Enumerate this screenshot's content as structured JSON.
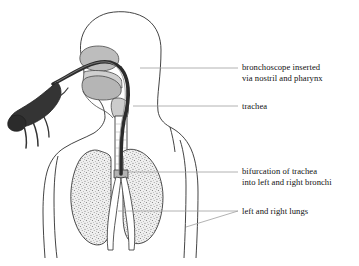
{
  "figure": {
    "colors": {
      "background": "#ffffff",
      "outline": "#2b2b2b",
      "soft_tissue_fill": "#b9b9b9",
      "soft_tissue_fill_light": "#cfcfcf",
      "lung_fill": "#e8e8e8",
      "lung_stipple": "#5d5d5d",
      "scope_dark": "#2e2e2e",
      "scope_handle": "#3a3a3a",
      "leader_line": "#9a9a9a",
      "text": "#111111"
    }
  },
  "labels": [
    {
      "id": "bronchoscope",
      "name": "bronchoscope-label",
      "lines": [
        "bronchoscope inserted",
        "via nostril and pharynx"
      ],
      "leader_from_x": 232,
      "leader_to_x": 140,
      "leader_y": 68
    },
    {
      "id": "trachea",
      "name": "trachea-label",
      "lines": [
        "trachea"
      ],
      "leader_from_x": 232,
      "leader_to_x": 134,
      "leader_y": 106
    },
    {
      "id": "bifurcation",
      "name": "bifurcation-label",
      "lines": [
        "bifurcation of trachea",
        "into left and right bronchi"
      ],
      "leader_from_x": 232,
      "leader_to_x": 130,
      "leader_y": 172
    },
    {
      "id": "lungs",
      "name": "lungs-label",
      "lines": [
        "left and right lungs"
      ],
      "leader_from_x": 232,
      "leader_to_x": 120,
      "leader_y": 211
    }
  ],
  "anatomy_parts": [
    {
      "name": "head-outline",
      "label": "head and face outline"
    },
    {
      "name": "torso-outline",
      "label": "neck, shoulders and chest outline"
    },
    {
      "name": "nasal-cavity",
      "label": "nasal cavity"
    },
    {
      "name": "hard-palate",
      "label": "hard palate"
    },
    {
      "name": "tongue",
      "label": "tongue"
    },
    {
      "name": "pharynx",
      "label": "pharynx"
    },
    {
      "name": "larynx",
      "label": "larynx"
    },
    {
      "name": "trachea-tube",
      "label": "trachea"
    },
    {
      "name": "carina",
      "label": "carina / bifurcation"
    },
    {
      "name": "left-lung",
      "label": "left lung"
    },
    {
      "name": "right-lung",
      "label": "right lung"
    },
    {
      "name": "left-bronchus",
      "label": "left main bronchus"
    },
    {
      "name": "right-bronchus",
      "label": "right main bronchus"
    },
    {
      "name": "bronchoscope-tube",
      "label": "bronchoscope flexible tube"
    },
    {
      "name": "bronchoscope-handle",
      "label": "bronchoscope handle"
    },
    {
      "name": "bronchoscope-cables",
      "label": "bronchoscope cables"
    }
  ]
}
